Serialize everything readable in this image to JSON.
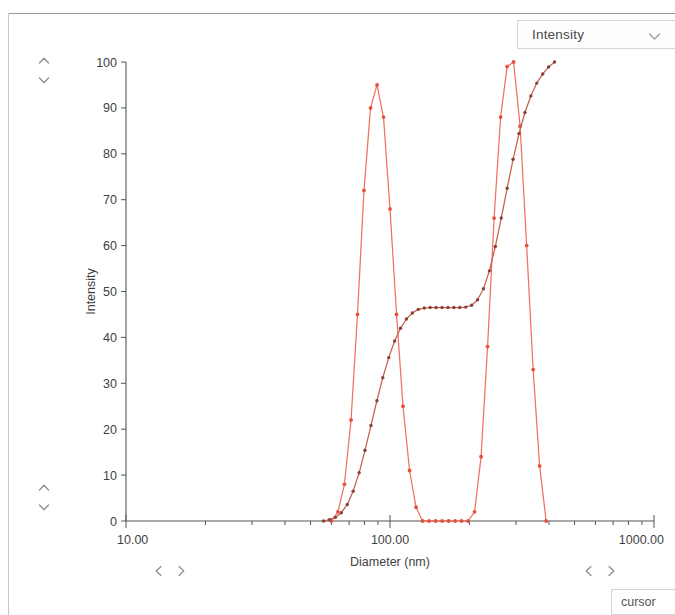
{
  "window": {
    "title": "Particle Size Distribution"
  },
  "series_selector": {
    "name": "series-select",
    "selected": "Intensity",
    "chevron_icon": "chevron-down-icon",
    "options": [
      "Intensity",
      "Volume",
      "Number"
    ]
  },
  "controls": {
    "scroll_up_icon": "chevron-up-icon",
    "scroll_down_icon": "chevron-down-icon",
    "scroll_left_icon": "chevron-left-icon",
    "scroll_right_icon": "chevron-right-icon",
    "cursor_label": "cursor"
  },
  "chart_data": {
    "type": "line",
    "title": "",
    "xlabel": "Diameter (nm)",
    "ylabel": "Intensity",
    "xscale": "log",
    "xlim": [
      10,
      1000
    ],
    "ylim": [
      0,
      100
    ],
    "xticks": [
      10,
      100,
      1000
    ],
    "xticklabels": [
      "10.00",
      "100.00",
      "1000.00"
    ],
    "yticks": [
      0,
      10,
      20,
      30,
      40,
      50,
      60,
      70,
      80,
      90,
      100
    ],
    "yticklabels": [
      "0",
      "10",
      "20",
      "30",
      "40",
      "50",
      "60",
      "70",
      "80",
      "90",
      "100"
    ],
    "grid": false,
    "legend": false,
    "marker": "circle",
    "series": [
      {
        "name": "Differential Intensity",
        "color": "#f2705e",
        "marker_color": "#e4523f",
        "x": [
          60.0,
          63.5,
          67.2,
          71.2,
          75.3,
          79.7,
          84.4,
          89.3,
          94.5,
          100.0,
          105.9,
          112.0,
          118.6,
          125.5,
          132.8,
          140.6,
          148.8,
          157.5,
          166.7,
          176.4,
          186.7,
          197.6,
          209.1,
          221.3,
          234.2,
          247.9,
          262.4,
          277.7,
          293.9,
          311.1,
          329.3,
          348.5,
          368.8,
          390.3
        ],
        "y": [
          0.0,
          2.0,
          8.0,
          22.0,
          45.0,
          72.0,
          90.0,
          95.0,
          88.0,
          68.0,
          45.0,
          25.0,
          11.0,
          3.0,
          0.0,
          0.0,
          0.0,
          0.0,
          0.0,
          0.0,
          0.0,
          0.0,
          2.0,
          14.0,
          38.0,
          66.0,
          88.0,
          99.0,
          100.0,
          86.0,
          60.0,
          33.0,
          12.0,
          0.0
        ]
      },
      {
        "name": "Cumulative Intensity",
        "color": "#c4604f",
        "marker_color": "#8a4234",
        "x": [
          56.0,
          59.0,
          62.1,
          65.4,
          68.9,
          72.5,
          76.4,
          80.4,
          84.7,
          89.2,
          93.9,
          98.9,
          104.1,
          109.6,
          115.4,
          121.5,
          128.0,
          134.8,
          142.0,
          149.5,
          157.4,
          165.8,
          174.6,
          183.8,
          193.6,
          203.8,
          214.6,
          226.0,
          238.0,
          250.6,
          263.9,
          277.9,
          292.6,
          308.1,
          324.4,
          341.6,
          359.7,
          378.8,
          398.8,
          420.0
        ],
        "y": [
          0.0,
          0.3,
          0.8,
          1.8,
          3.6,
          6.5,
          10.5,
          15.4,
          20.8,
          26.2,
          31.2,
          35.6,
          39.2,
          42.0,
          44.0,
          45.3,
          46.1,
          46.4,
          46.5,
          46.5,
          46.5,
          46.5,
          46.5,
          46.5,
          46.6,
          47.0,
          48.2,
          50.6,
          54.5,
          59.8,
          66.0,
          72.5,
          78.8,
          84.4,
          89.0,
          92.6,
          95.4,
          97.4,
          98.9,
          100.0
        ]
      }
    ]
  }
}
